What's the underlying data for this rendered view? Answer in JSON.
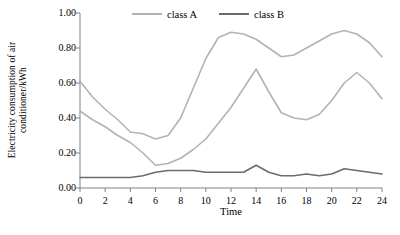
{
  "chart_data": {
    "type": "line",
    "title": "",
    "xlabel": "Time",
    "ylabel": "Electricity consumption of air conditioner/kWh",
    "ylabel_line1": "Electricity consumption of air",
    "ylabel_line2": "conditioner/kWh",
    "xlim": [
      0,
      24
    ],
    "ylim": [
      0,
      1.0
    ],
    "x_ticks": [
      0,
      2,
      4,
      6,
      8,
      10,
      12,
      14,
      16,
      18,
      20,
      22,
      24
    ],
    "x_tick_labels": [
      "0",
      "2",
      "4",
      "6",
      "8",
      "10",
      "12",
      "14",
      "16",
      "18",
      "20",
      "22",
      "24"
    ],
    "y_ticks": [
      0.0,
      0.2,
      0.4,
      0.6,
      0.8,
      1.0
    ],
    "y_tick_labels": [
      "0.00",
      "0.20",
      "0.40",
      "0.60",
      "0.80",
      "1.00"
    ],
    "grid": false,
    "legend_position": "top-center",
    "x": [
      0,
      1,
      2,
      3,
      4,
      5,
      6,
      7,
      8,
      9,
      10,
      11,
      12,
      13,
      14,
      15,
      16,
      17,
      18,
      19,
      20,
      21,
      22,
      23,
      24
    ],
    "series": [
      {
        "name": "class A",
        "color": "#b3b3b3",
        "values": [
          0.61,
          0.52,
          0.45,
          0.39,
          0.32,
          0.31,
          0.28,
          0.3,
          0.4,
          0.57,
          0.74,
          0.86,
          0.89,
          0.88,
          0.85,
          0.8,
          0.75,
          0.76,
          0.8,
          0.84,
          0.88,
          0.9,
          0.88,
          0.83,
          0.75
        ]
      },
      {
        "name": "class A",
        "color": "#b3b3b3",
        "values": [
          0.44,
          0.39,
          0.35,
          0.3,
          0.26,
          0.2,
          0.13,
          0.14,
          0.17,
          0.22,
          0.28,
          0.37,
          0.46,
          0.57,
          0.68,
          0.55,
          0.43,
          0.4,
          0.39,
          0.42,
          0.5,
          0.6,
          0.66,
          0.6,
          0.51
        ]
      },
      {
        "name": "class B",
        "color": "#6b6b6b",
        "values": [
          0.06,
          0.06,
          0.06,
          0.06,
          0.06,
          0.07,
          0.09,
          0.1,
          0.1,
          0.1,
          0.09,
          0.09,
          0.09,
          0.09,
          0.13,
          0.09,
          0.07,
          0.07,
          0.08,
          0.07,
          0.08,
          0.11,
          0.1,
          0.09,
          0.08
        ]
      }
    ],
    "legend": [
      {
        "label": "class A",
        "color": "#b3b3b3"
      },
      {
        "label": "class B",
        "color": "#6b6b6b"
      }
    ],
    "axis_color": "#808080"
  }
}
